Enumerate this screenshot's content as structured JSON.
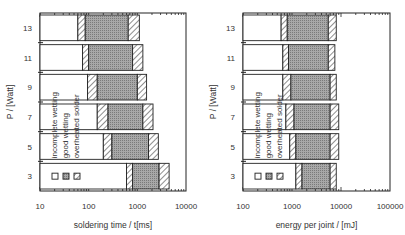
{
  "chart_data": [
    {
      "type": "bar",
      "subtype": "stacked-horizontal-log",
      "title": "",
      "xlabel": "soldering time / t[ms]",
      "ylabel": "P / [Watt]",
      "xscale": "log",
      "xlim": [
        10,
        10000
      ],
      "xticks": [
        "10",
        "100",
        "1000",
        "10000"
      ],
      "categories": [
        "13",
        "11",
        "9",
        "7",
        "5",
        "3"
      ],
      "legend": [
        "incomplete wetting",
        "good wetting",
        "overheated solder"
      ],
      "boundaries_note": "each row: [end of incomplete wetting, end of transition, end of good wetting, end of overheated solder]",
      "rows": [
        {
          "P": 13,
          "values": [
            60,
            85,
            650,
            1100
          ]
        },
        {
          "P": 11,
          "values": [
            75,
            100,
            800,
            1300
          ]
        },
        {
          "P": 9,
          "values": [
            95,
            150,
            1000,
            1550
          ]
        },
        {
          "P": 7,
          "values": [
            150,
            250,
            1300,
            2100
          ]
        },
        {
          "P": 5,
          "values": [
            200,
            300,
            1700,
            2700
          ]
        },
        {
          "P": 3,
          "values": [
            600,
            800,
            2800,
            4500
          ]
        }
      ]
    },
    {
      "type": "bar",
      "subtype": "stacked-horizontal-log",
      "title": "",
      "xlabel": "energy per joint / [mJ]",
      "ylabel": "P / [Watt]",
      "xscale": "log",
      "xlim": [
        100,
        100000
      ],
      "xticks": [
        "100",
        "1000",
        "10000",
        "100000"
      ],
      "categories": [
        "13",
        "11",
        "9",
        "7",
        "5",
        "3"
      ],
      "legend": [
        "incomplete wetting",
        "good wetting",
        "overheated solder"
      ],
      "boundaries_note": "each row: [end of incomplete wetting, end of transition, end of good wetting, end of overheated solder]",
      "rows": [
        {
          "P": 13,
          "values": [
            600,
            800,
            5500,
            8000
          ]
        },
        {
          "P": 11,
          "values": [
            650,
            850,
            5500,
            7500
          ]
        },
        {
          "P": 9,
          "values": [
            650,
            950,
            6000,
            8000
          ]
        },
        {
          "P": 7,
          "values": [
            750,
            1100,
            6000,
            9000
          ]
        },
        {
          "P": 5,
          "values": [
            900,
            1200,
            6000,
            9000
          ]
        },
        {
          "P": 3,
          "values": [
            1200,
            1600,
            6000,
            8000
          ]
        }
      ]
    }
  ],
  "left": {
    "xlabel": "soldering time / t[ms]",
    "ylabel": "P / [Watt]",
    "ticks": [
      "10",
      "100",
      "1000",
      "10000"
    ],
    "rows": [
      "13",
      "11",
      "9",
      "7",
      "5",
      "3"
    ]
  },
  "right": {
    "xlabel": "energy per joint / [mJ]",
    "ylabel": "P / [Watt]",
    "ticks": [
      "100",
      "1000",
      "10000",
      "100000"
    ],
    "rows": [
      "13",
      "11",
      "9",
      "7",
      "5",
      "3"
    ]
  },
  "legend": {
    "incomplete": "incomplete wetting",
    "good": "good wetting",
    "overheated": "overheated solder"
  },
  "colors": {
    "good": "#9a9a9a",
    "frame": "#222222"
  }
}
